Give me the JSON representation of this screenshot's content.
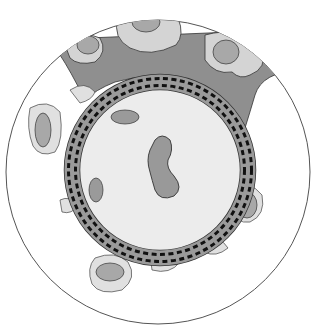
{
  "diagram": {
    "type": "cross-section illustration",
    "colors": {
      "background": "#ffffff",
      "outer_circle_stroke": "#555555",
      "dark_tissue": "#8f8f8f",
      "light_cell": "#d4d4d4",
      "nucleus": "#a8a8a8",
      "lumen": "#ececec",
      "ring_band": "#9a9a9a",
      "dash": "#111111",
      "outline": "#333333"
    },
    "elements": [
      {
        "name": "outer-boundary-circle"
      },
      {
        "name": "surrounding-tissue-top"
      },
      {
        "name": "vessel-wall-ring",
        "dashed_rows": 2
      },
      {
        "name": "lumen"
      },
      {
        "name": "central-cell"
      },
      {
        "name": "perivascular-cells"
      }
    ]
  }
}
